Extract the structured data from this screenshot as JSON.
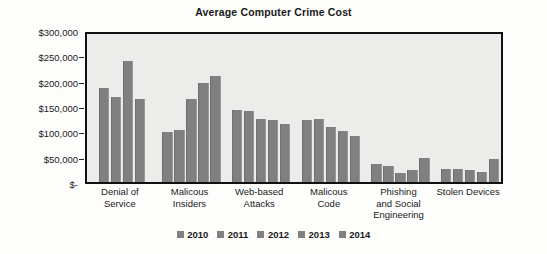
{
  "chart_data": {
    "type": "bar",
    "title": "Average Computer Crime Cost",
    "xlabel": "",
    "ylabel": "",
    "ylim": [
      0,
      300000
    ],
    "grid": false,
    "legend_position": "bottom",
    "y_ticks": [
      {
        "value": 300000,
        "label": "$300,000"
      },
      {
        "value": 250000,
        "label": "$250,000"
      },
      {
        "value": 200000,
        "label": "$200,000"
      },
      {
        "value": 150000,
        "label": "$150,000"
      },
      {
        "value": 100000,
        "label": "$100,000"
      },
      {
        "value": 50000,
        "label": "$50,000"
      },
      {
        "value": 0,
        "label": "$-"
      }
    ],
    "categories": [
      "Denial of Service",
      "Malicous Insiders",
      "Web-based Attacks",
      "Malicous Code",
      "Phishing and Social Engineering",
      "Stolen Devices"
    ],
    "category_lines": [
      [
        "Denial of",
        "Service"
      ],
      [
        "Malicous",
        "Insiders"
      ],
      [
        "Web-based",
        "Attacks"
      ],
      [
        "Malicous",
        "Code"
      ],
      [
        "Phishing",
        "and Social",
        "Engineering"
      ],
      [
        "Stolen Devices"
      ]
    ],
    "series": [
      {
        "name": "2010",
        "color": "#808080",
        "values": [
          null,
          98000,
          142000,
          122000,
          35000,
          26000
        ]
      },
      {
        "name": "2011",
        "color": "#808080",
        "values": [
          186000,
          103000,
          140000,
          125000,
          31000,
          26000
        ]
      },
      {
        "name": "2012",
        "color": "#808080",
        "values": [
          168000,
          164000,
          125000,
          108000,
          18000,
          23000
        ]
      },
      {
        "name": "2013",
        "color": "#808080",
        "values": [
          239000,
          195000,
          123000,
          101000,
          24000,
          20000
        ]
      },
      {
        "name": "2014",
        "color": "#808080",
        "values": [
          163000,
          210000,
          115000,
          91000,
          48000,
          45000
        ]
      }
    ]
  },
  "colors": {
    "bar": "#808080",
    "plot_background": "#ececeb",
    "plot_border": "#111111",
    "text": "#1a1a1a"
  }
}
